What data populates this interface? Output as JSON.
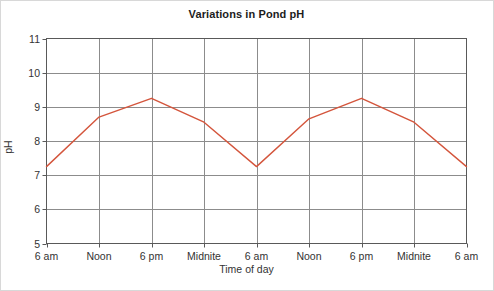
{
  "chart_data": {
    "type": "line",
    "title": "Variations in Pond pH",
    "xlabel": "Time of day",
    "ylabel": "pH",
    "categories": [
      "6 am",
      "Noon",
      "6 pm",
      "Midnite",
      "6 am",
      "Noon",
      "6 pm",
      "Midnite",
      "6 am"
    ],
    "values": [
      7.25,
      8.7,
      9.25,
      8.55,
      7.25,
      8.65,
      9.25,
      8.55,
      7.25
    ],
    "series": [
      {
        "name": "Pond pH",
        "values": [
          7.25,
          8.7,
          9.25,
          8.55,
          7.25,
          8.65,
          9.25,
          8.55,
          7.25
        ]
      }
    ],
    "ylim": [
      5,
      11
    ],
    "yticks": [
      "5",
      "6",
      "7",
      "8",
      "9",
      "10",
      "11"
    ],
    "ytick_values": [
      5,
      6,
      7,
      8,
      9,
      10,
      11
    ],
    "grid": "both",
    "legend": "none",
    "line_color": "#d4553c",
    "grid_color": "#8c8c8c",
    "axis_color": "#595959",
    "background": "#ffffff"
  }
}
